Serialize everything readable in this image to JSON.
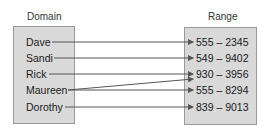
{
  "diagram": {
    "domain_title": "Domain",
    "range_title": "Range",
    "domain": [
      "Dave",
      "Sandi",
      "Rick",
      "Maureen",
      "Dorothy"
    ],
    "range": [
      "555 – 2345",
      "549 – 9402",
      "930 – 3956",
      "555 – 8294",
      "839 – 9013"
    ],
    "mappings": [
      {
        "from": "Dave",
        "to": "555 – 2345"
      },
      {
        "from": "Sandi",
        "to": "549 – 9402"
      },
      {
        "from": "Rick",
        "to": "930 – 3956"
      },
      {
        "from": "Maureen",
        "to": "930 – 3956"
      },
      {
        "from": "Maureen",
        "to": "555 – 8294"
      },
      {
        "from": "Dorothy",
        "to": "839 – 9013"
      }
    ],
    "colors": {
      "box_fill": "#d9d9d9",
      "box_border": "#9a9a9a",
      "arrow": "#555555"
    }
  }
}
